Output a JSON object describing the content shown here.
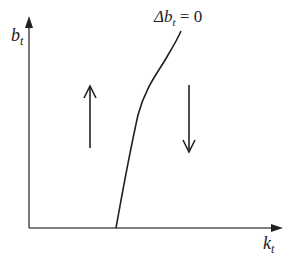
{
  "diagram": {
    "type": "phase-diagram",
    "y_axis": {
      "label": "b",
      "subscript": "t"
    },
    "x_axis": {
      "label": "k",
      "subscript": "t"
    },
    "curve": {
      "label_prefix": "Δb",
      "label_subscript": "t",
      "label_suffix": " = 0"
    },
    "arrows": [
      {
        "region": "left-of-curve",
        "direction": "up"
      },
      {
        "region": "right-of-curve",
        "direction": "down"
      }
    ],
    "colors": {
      "line": "#222222",
      "axis": "#555555",
      "background": "#ffffff"
    }
  }
}
